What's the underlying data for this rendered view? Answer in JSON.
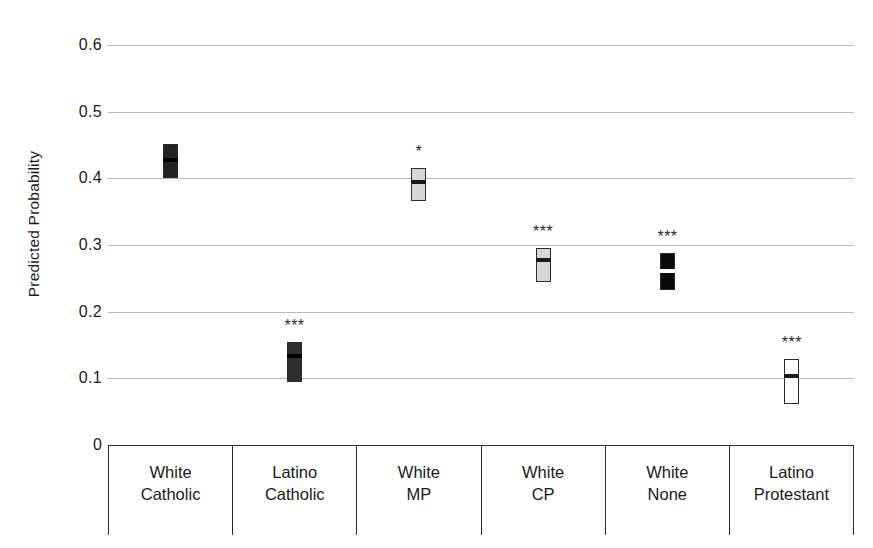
{
  "chart_data": {
    "type": "scatter",
    "title": "",
    "subtitle": "",
    "xlabel": "",
    "ylabel": "Predicted Probability",
    "ylim": [
      0,
      0.6
    ],
    "yticks": [
      0.6,
      0.5,
      0.4,
      0.3,
      0.2,
      0.1,
      0
    ],
    "ytick_labels": [
      "0.6",
      "0.5",
      "0.4",
      "0.3",
      "0.2",
      "0.1",
      "0"
    ],
    "grid": true,
    "legend": "none",
    "categories": [
      "White Catholic",
      "Latino Catholic",
      "White MP",
      "White CP",
      "White None",
      "Latino Protestant"
    ],
    "category_lines": [
      [
        "White",
        "Catholic"
      ],
      [
        "Latino",
        "Catholic"
      ],
      [
        "White",
        "MP"
      ],
      [
        "White",
        "CP"
      ],
      [
        "White",
        "None"
      ],
      [
        "Latino",
        "Protestant"
      ]
    ],
    "series": [
      {
        "name": "Predicted Probability",
        "points": [
          {
            "category": "White Catholic",
            "estimate": 0.427,
            "ci_low": 0.4,
            "ci_high": 0.451,
            "significance": "",
            "fill": "#232323",
            "estimate_color": "#000000"
          },
          {
            "category": "Latino Catholic",
            "estimate": 0.133,
            "ci_low": 0.095,
            "ci_high": 0.155,
            "significance": "***",
            "fill": "#2e2e2e",
            "estimate_color": "#000000"
          },
          {
            "category": "White MP",
            "estimate": 0.395,
            "ci_low": 0.366,
            "ci_high": 0.415,
            "significance": "*",
            "fill": "#d6d6d6",
            "estimate_color": "#1a1a1a"
          },
          {
            "category": "White CP",
            "estimate": 0.277,
            "ci_low": 0.245,
            "ci_high": 0.295,
            "significance": "***",
            "fill": "#d6d6d6",
            "estimate_color": "#1a1a1a"
          },
          {
            "category": "White None",
            "estimate": 0.261,
            "ci_low": 0.233,
            "ci_high": 0.288,
            "significance": "***",
            "fill": "#0a0a0a",
            "estimate_color": "#ffffff"
          },
          {
            "category": "Latino Protestant",
            "estimate": 0.103,
            "ci_low": 0.061,
            "ci_high": 0.129,
            "significance": "***",
            "fill": "#ffffff",
            "estimate_color": "#1a1a1a"
          }
        ]
      }
    ],
    "colors": {
      "gridline": "#b9b9b9",
      "axis": "#2b2b2b",
      "text": "#1a1a1a"
    }
  }
}
